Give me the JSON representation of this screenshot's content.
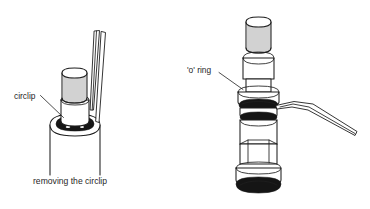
{
  "figure": {
    "type": "technical-line-illustration",
    "background_color": "#ffffff",
    "line_color": "#1f1f1f",
    "accent_color": "#151515",
    "panels": [
      {
        "id": "left-panel",
        "caption": "removing the circlip",
        "label": "circlip",
        "subject": "valve cartridge with knurled cap and circlip groove",
        "tool": "circlip pliers"
      },
      {
        "id": "right-panel",
        "label": "'o' ring",
        "subject": "valve cartridge body with knurled top, o-rings, hex nut and black base seal",
        "tool": "pick hook"
      }
    ]
  },
  "left_panel": {
    "label_circlip": "circlip",
    "caption": "removing the circlip"
  },
  "right_panel": {
    "label_o_ring": "'o' ring"
  }
}
